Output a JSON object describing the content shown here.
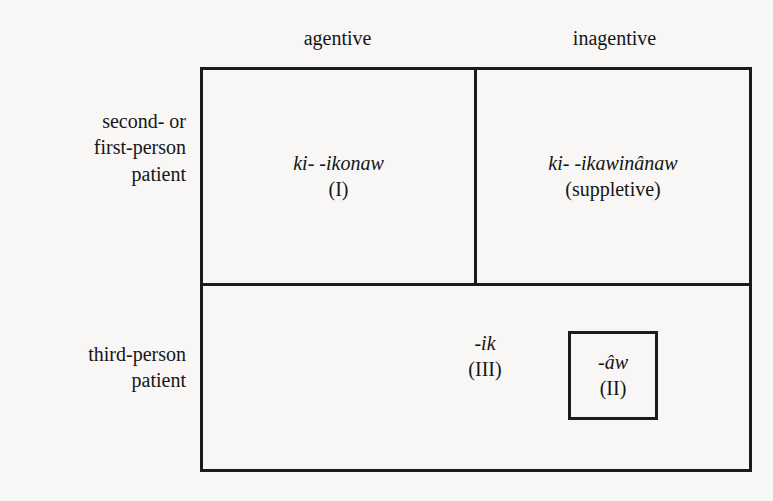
{
  "figure": {
    "type": "linguistic-paradigm-table",
    "background_color": "#f8f7f6",
    "ink_color": "#1a1a1a",
    "border_color": "#1c1c1c"
  },
  "columns": [
    {
      "id": "agentive",
      "label": "agentive"
    },
    {
      "id": "inagentive",
      "label": "inagentive"
    }
  ],
  "rows": [
    {
      "id": "second-or-first-person-patient",
      "label_lines": [
        "second- or",
        "first-person",
        "patient"
      ],
      "label_line_1": "second- or",
      "label_line_2": "first-person",
      "label_line_3": "patient"
    },
    {
      "id": "third-person-patient",
      "label_lines": [
        "third-person",
        "patient"
      ],
      "label_line_1": "third-person",
      "label_line_2": "patient"
    }
  ],
  "cells": {
    "agentive_12person": {
      "form": "ki- -ikonaw",
      "gloss": "(I)",
      "boxed": false
    },
    "inagentive_12person": {
      "form": "ki- -ikawinânaw",
      "gloss": "(suppletive)",
      "boxed": false
    },
    "third_person_ik": {
      "form": "-ik",
      "gloss": "(III)",
      "boxed": false
    },
    "third_person_aw": {
      "form": "-âw",
      "gloss": "(II)",
      "boxed": true
    }
  }
}
